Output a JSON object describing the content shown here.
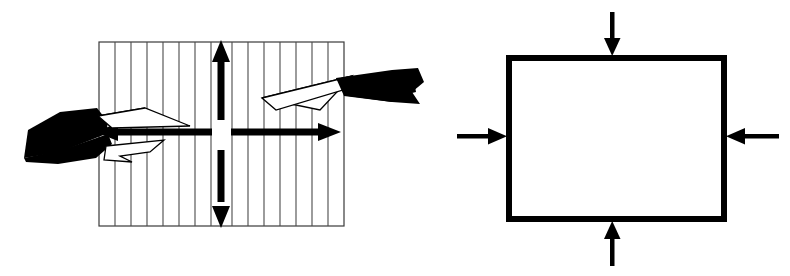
{
  "figure": {
    "background_color": "#ffffff",
    "ink_color": "#000000",
    "width": 790,
    "height": 276,
    "panels": [
      {
        "id": "left-panel",
        "name": "tension-specimen-panel",
        "description": "Hatched rectangular specimen with bidirectional tension arrows and black load-application wedges",
        "specimen": {
          "name": "hatched-rectangle",
          "x": 99,
          "y": 42,
          "width": 245,
          "height": 184,
          "border_color": "#333333",
          "border_width": 1,
          "fill": "#ffffff",
          "hatch": {
            "orientation": "vertical",
            "line_count": 15,
            "spacing": 16,
            "line_width": 1,
            "color": "#444444"
          }
        },
        "arrows": [
          {
            "name": "vertical-double-arrow",
            "direction": "vertical-bidirectional",
            "x": 221,
            "y_top": 43,
            "y_bottom": 225,
            "shaft_width": 7,
            "gap_top": 118,
            "gap_bottom": 148,
            "color": "#000000"
          },
          {
            "name": "horizontal-double-arrow",
            "direction": "horizontal-bidirectional",
            "y": 132,
            "x_left": 97,
            "x_right": 338,
            "shaft_width": 7,
            "gap_left": 213,
            "gap_right": 229,
            "color": "#000000"
          }
        ],
        "wedges": [
          {
            "name": "left-black-wedge",
            "side": "left",
            "color": "#000000"
          },
          {
            "name": "left-white-outline-wedge",
            "side": "left",
            "color": "#ffffff",
            "stroke": "#000000"
          },
          {
            "name": "right-black-wedge",
            "side": "right",
            "color": "#000000"
          },
          {
            "name": "right-white-outline-wedge",
            "side": "right",
            "color": "#ffffff",
            "stroke": "#000000"
          }
        ]
      },
      {
        "id": "right-panel",
        "name": "compression-element-panel",
        "description": "Open square outline with four inward-pointing compression arrows",
        "element": {
          "name": "square-outline",
          "x": 506,
          "y": 55,
          "width": 221,
          "height": 167,
          "border_color": "#000000",
          "border_width": 6,
          "fill": "#ffffff"
        },
        "arrows": [
          {
            "name": "top-compression-arrow",
            "direction": "down",
            "x": 612,
            "y_start": 12,
            "y_end": 55,
            "shaft_width": 4,
            "head_width": 16,
            "head_length": 16,
            "color": "#000000"
          },
          {
            "name": "bottom-compression-arrow",
            "direction": "up",
            "x": 612,
            "y_start": 265,
            "y_end": 222,
            "shaft_width": 4,
            "head_width": 16,
            "head_length": 16,
            "color": "#000000"
          },
          {
            "name": "left-compression-arrow",
            "direction": "right",
            "y": 136,
            "x_start": 457,
            "x_end": 506,
            "shaft_width": 4,
            "head_width": 16,
            "head_length": 16,
            "color": "#000000"
          },
          {
            "name": "right-compression-arrow",
            "direction": "left",
            "y": 136,
            "x_start": 779,
            "x_end": 727,
            "shaft_width": 4,
            "head_width": 16,
            "head_length": 16,
            "color": "#000000"
          }
        ]
      }
    ],
    "stray_marks": [
      {
        "name": "stray-black-fleck",
        "description": "Small black wedge remnant near left of right panel",
        "x": 396,
        "y": 75,
        "color": "#000000"
      }
    ],
    "labels": []
  }
}
